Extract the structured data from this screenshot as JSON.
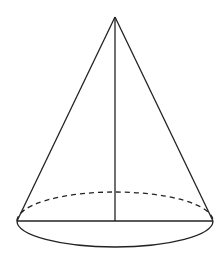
{
  "diagram": {
    "type": "cone",
    "stroke_color": "#222222",
    "background": "#ffffff",
    "apex": {
      "x": 115,
      "y": 17
    },
    "base": {
      "center": {
        "x": 115,
        "y": 221
      },
      "rx": 98,
      "ry_front": 26,
      "ry_back": 29,
      "back_arc_style": "dashed",
      "front_arc_style": "solid"
    },
    "elements": [
      {
        "name": "left-slant-edge",
        "from": [
          17,
          221
        ],
        "to": [
          115,
          17
        ]
      },
      {
        "name": "right-slant-edge",
        "from": [
          213,
          221
        ],
        "to": [
          115,
          17
        ]
      },
      {
        "name": "height-line",
        "from": [
          115,
          17
        ],
        "to": [
          115,
          221
        ]
      },
      {
        "name": "base-diameter",
        "from": [
          17,
          221
        ],
        "to": [
          213,
          221
        ]
      }
    ]
  }
}
